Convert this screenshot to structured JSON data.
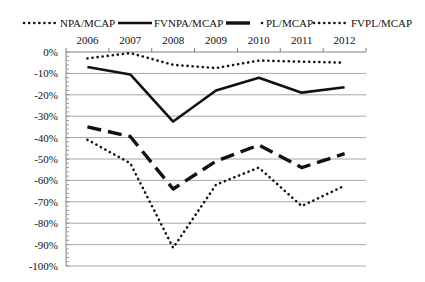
{
  "chart_data": {
    "type": "line",
    "title": "",
    "xlabel": "",
    "ylabel": "",
    "categories": [
      "2006",
      "2007",
      "2008",
      "2009",
      "2010",
      "2011",
      "2012"
    ],
    "x_axis_position": "top",
    "ylim": [
      -100,
      0
    ],
    "y_ticks": [
      "0%",
      "-10%",
      "-20%",
      "-30%",
      "-40%",
      "-50%",
      "-60%",
      "-70%",
      "-80%",
      "-90%",
      "-100%"
    ],
    "y_tick_values": [
      0,
      -10,
      -20,
      -30,
      -40,
      -50,
      -60,
      -70,
      -80,
      -90,
      -100
    ],
    "grid": true,
    "legend_position": "top",
    "series": [
      {
        "name": "NPA/MCAP",
        "style": "dotted",
        "values": [
          -3,
          -0.5,
          -6,
          -7.5,
          -4,
          -4.5,
          -5
        ]
      },
      {
        "name": "FVNPA/MCAP",
        "style": "solid",
        "values": [
          -7,
          -10.5,
          -32.5,
          -18,
          -12,
          -19,
          -16.5
        ]
      },
      {
        "name": "PL/MCAP",
        "style": "long-dash",
        "values": [
          -35,
          -39.5,
          -64,
          -51,
          -43.5,
          -54,
          -47.5
        ]
      },
      {
        "name": "FVPL/MCAP",
        "style": "dotted",
        "values": [
          -41,
          -52,
          -91.5,
          -62,
          -54,
          -72,
          -62.5
        ]
      }
    ]
  },
  "legend": {
    "items": [
      {
        "label": "NPA/MCAP"
      },
      {
        "label": "FVNPA/MCAP"
      },
      {
        "label": "PL/MCAP"
      },
      {
        "label": "FVPL/MCAP"
      }
    ]
  },
  "colors": {
    "line": "#111111",
    "grid": "#a6a6a6",
    "axis": "#808080"
  }
}
